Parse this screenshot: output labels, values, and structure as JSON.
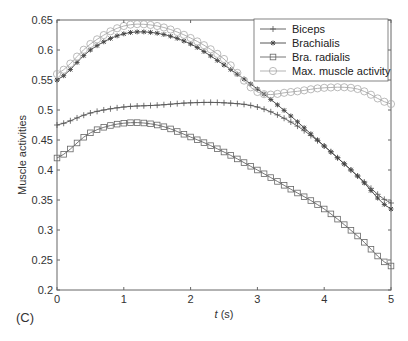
{
  "panel_label": "(C)",
  "chart_data": {
    "type": "line",
    "title": "",
    "xlabel": "t (s)",
    "xlabel_italic_part": "t",
    "xlabel_unit": " (s)",
    "ylabel": "Muscle activities",
    "xlim": [
      0,
      5
    ],
    "ylim": [
      0.2,
      0.65
    ],
    "xticks": [
      0,
      1,
      2,
      3,
      4,
      5
    ],
    "xtick_labels": [
      "0",
      "1",
      "2",
      "3",
      "4",
      "5"
    ],
    "yticks": [
      0.2,
      0.25,
      0.3,
      0.35,
      0.4,
      0.45,
      0.5,
      0.55,
      0.6,
      0.65
    ],
    "ytick_labels": [
      "0.2",
      "0.25",
      "0.3",
      "0.35",
      "0.4",
      "0.45",
      "0.5",
      "0.55",
      "0.6",
      "0.65"
    ],
    "grid": false,
    "legend_position": "upper right",
    "x": [
      0,
      0.5,
      1,
      1.5,
      2,
      2.5,
      3,
      3.5,
      4,
      4.5,
      5
    ],
    "series": [
      {
        "name": "Biceps",
        "marker": "plus",
        "color": "#555555",
        "values": [
          0.475,
          0.495,
          0.505,
          0.508,
          0.512,
          0.512,
          0.505,
          0.48,
          0.44,
          0.39,
          0.345
        ]
      },
      {
        "name": "Brachialis",
        "marker": "asterisk",
        "color": "#444444",
        "values": [
          0.55,
          0.6,
          0.627,
          0.628,
          0.61,
          0.575,
          0.535,
          0.49,
          0.44,
          0.39,
          0.335
        ]
      },
      {
        "name": "Bra. radialis",
        "marker": "square",
        "color": "#666666",
        "values": [
          0.42,
          0.462,
          0.478,
          0.475,
          0.455,
          0.43,
          0.4,
          0.368,
          0.335,
          0.29,
          0.24
        ]
      },
      {
        "name": "Max. muscle activity",
        "marker": "circle",
        "color": "#aaaaaa",
        "values": [
          0.56,
          0.61,
          0.64,
          0.64,
          0.62,
          0.585,
          0.53,
          0.53,
          0.537,
          0.535,
          0.51
        ]
      }
    ]
  }
}
